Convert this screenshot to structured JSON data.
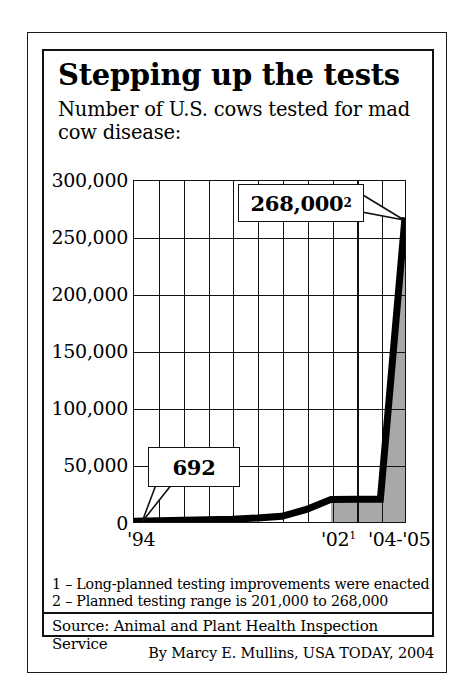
{
  "title": "Stepping up the tests",
  "subtitle": "Number of U.S. cows tested for mad cow disease:",
  "footnotes": {
    "note1": "1 – Long-planned testing improvements were enacted",
    "note2": "2 – Planned testing range is 201,000 to 268,000"
  },
  "source": "Source: Animal and Plant Health Inspection Service",
  "credit": "By Marcy E. Mullins, USA TODAY, 2004",
  "callouts": {
    "start_value": "692",
    "end_value": "268,000",
    "end_superscript": "2"
  },
  "colors": {
    "line": "#000000",
    "fill": "#a8a8a8",
    "grid": "#111111",
    "background": "#ffffff"
  },
  "chart_data": {
    "type": "line",
    "title": "Stepping up the tests",
    "subtitle": "Number of U.S. cows tested for mad cow disease:",
    "xlabel": "",
    "ylabel": "",
    "ylim": [
      0,
      300000
    ],
    "yticks": [
      0,
      50000,
      100000,
      150000,
      200000,
      250000,
      300000
    ],
    "ytick_labels": [
      "0",
      "50,000",
      "100,000",
      "150,000",
      "200,000",
      "250,000",
      "300,000"
    ],
    "grid": true,
    "legend": false,
    "x": [
      "'94",
      "'95",
      "'96",
      "'97",
      "'98",
      "'99",
      "'00",
      "'01",
      "'02",
      "'03",
      "'04",
      "'05"
    ],
    "xtick_labels_shown": [
      "'94",
      "'02",
      "'04",
      "'05"
    ],
    "values": [
      692,
      1000,
      1500,
      2000,
      2500,
      3500,
      5000,
      11000,
      19900,
      20000,
      20000,
      268000
    ],
    "annotations": [
      {
        "label": "692",
        "x": "'94",
        "y": 692
      },
      {
        "label": "268,000",
        "superscript": "2",
        "x": "'05",
        "y": 268000
      }
    ],
    "shaded_region": {
      "from": "'02",
      "to": "'05",
      "color": "#a8a8a8"
    }
  }
}
